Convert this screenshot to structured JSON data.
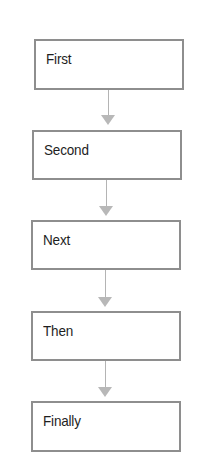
{
  "diagram": {
    "type": "vertical-flowchart",
    "colors": {
      "box_border": "#8e8e8e",
      "box_fill": "#ffffff",
      "text": "#1e1e1e",
      "connector": "#b4b4b4",
      "arrowhead": "#b8b8b8"
    },
    "steps": [
      {
        "label": "First"
      },
      {
        "label": "Second"
      },
      {
        "label": "Next"
      },
      {
        "label": "Then"
      },
      {
        "label": "Finally"
      }
    ],
    "connections": [
      {
        "from": "First",
        "to": "Second"
      },
      {
        "from": "Second",
        "to": "Next"
      },
      {
        "from": "Next",
        "to": "Then"
      },
      {
        "from": "Then",
        "to": "Finally"
      }
    ]
  }
}
